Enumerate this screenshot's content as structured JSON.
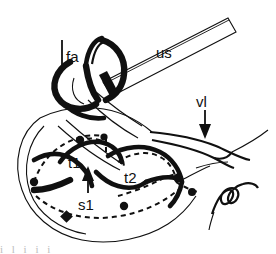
{
  "figure": {
    "background_color": "#ffffff",
    "ink_color": "#101010",
    "width": 276,
    "height": 254,
    "style": "black-and-white pen-and-ink schematic"
  },
  "labels": {
    "fa": "fa",
    "us": "us",
    "vl": "vl",
    "t1": "t1",
    "s1": "s1",
    "t2": "t2"
  },
  "annotations": {
    "fa_leader": "vertical leader line to fa",
    "vl_arrow": "down-arrow from vl",
    "s1_arrow": "up-arrow from s1",
    "signature": "cursive artist mark"
  },
  "bottom_strip": {
    "clipped_text": "i l i i i"
  }
}
